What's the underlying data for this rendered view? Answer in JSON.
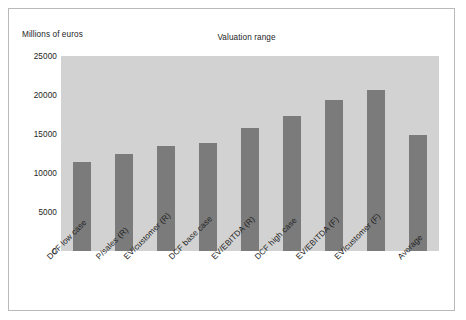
{
  "chart_data": {
    "type": "bar",
    "title": "Valuation range",
    "xlabel": "",
    "ylabel": "Millions of euros",
    "ylim": [
      0,
      25000
    ],
    "yticks": [
      25000,
      20000,
      15000,
      10000,
      5000,
      0
    ],
    "grid": false,
    "legend": null,
    "categories": [
      "DCF low case",
      "P/sales (R)",
      "EV/customer (R)",
      "DCF base case",
      "EV/EBITDA (R)",
      "DCF high case",
      "EV/EBITDA (F)",
      "EV/customer (F)",
      "Average"
    ],
    "values": [
      11400,
      12400,
      13500,
      13900,
      15800,
      17300,
      19400,
      20600,
      14900
    ],
    "colors": {
      "bar": "#7b7b7b",
      "plot_background": "#d2d2d2",
      "figure_background": "#ffffff",
      "frame_border": "#b9b9b9",
      "text": "#1d1d1d"
    }
  }
}
